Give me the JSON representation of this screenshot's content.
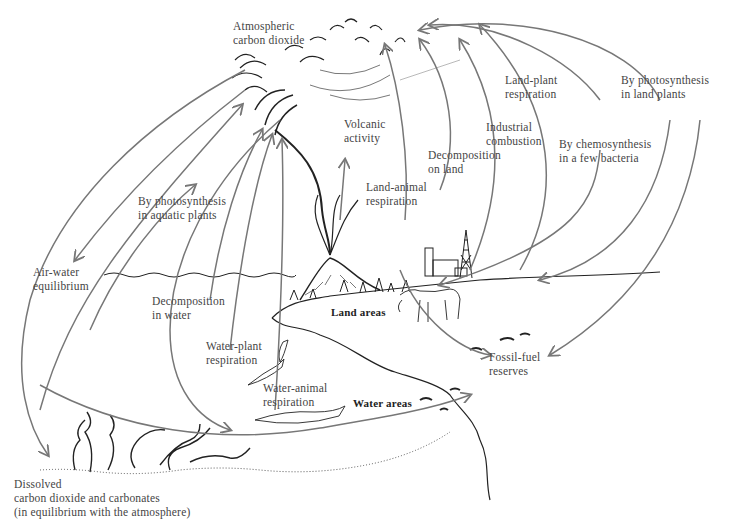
{
  "diagram": {
    "labels": {
      "atmosphere": [
        "Atmospheric",
        "carbon dioxide"
      ],
      "volcanic": [
        "Volcanic",
        "activity"
      ],
      "land_animal": [
        "Land-animal",
        "respiration"
      ],
      "decomp_land": [
        "Decomposition",
        "on land"
      ],
      "industrial": [
        "Industrial",
        "combustion"
      ],
      "land_plant": [
        "Land-plant",
        "respiration"
      ],
      "chemosynthesis": [
        "By chemosynthesis",
        "in a few bacteria"
      ],
      "photo_land": [
        "By photosynthesis",
        "in land plants"
      ],
      "photo_aquatic": [
        "By photosynthesis",
        "in aquatic plants"
      ],
      "air_water": [
        "Air-water",
        "equilibrium"
      ],
      "decomp_water": [
        "Decomposition",
        "in water"
      ],
      "water_plant": [
        "Water-plant",
        "respiration"
      ],
      "water_animal": [
        "Water-animal",
        "respiration"
      ],
      "land_areas": "Land areas",
      "water_areas": "Water areas",
      "fossil": [
        "Fossil-fuel",
        "reserves"
      ],
      "dissolved": [
        "Dissolved",
        "carbon dioxide and carbonates",
        "(in equilibrium with the atmosphere)"
      ]
    },
    "colors": {
      "arrow": "#777777",
      "ink": "#222222",
      "text": "#444444"
    }
  }
}
